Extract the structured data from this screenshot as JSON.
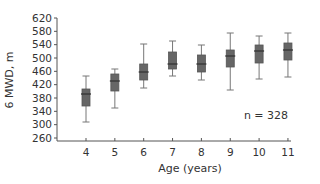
{
  "chart_data": {
    "type": "box",
    "title": "",
    "xlabel": "Age (years)",
    "ylabel": "6 MWD, m",
    "ylim": [
      260,
      620
    ],
    "yticks": [
      260,
      300,
      340,
      380,
      420,
      460,
      500,
      540,
      580,
      620
    ],
    "categories": [
      "4",
      "5",
      "6",
      "7",
      "8",
      "9",
      "10",
      "11"
    ],
    "grid": false,
    "legend": null,
    "annotations": [
      "n = 328"
    ],
    "boxes": [
      {
        "category": "4",
        "whisker_low": 308,
        "q1": 356,
        "median": 392,
        "q3": 407,
        "whisker_high": 446
      },
      {
        "category": "5",
        "whisker_low": 350,
        "q1": 401,
        "median": 431,
        "q3": 452,
        "whisker_high": 467
      },
      {
        "category": "6",
        "whisker_low": 410,
        "q1": 434,
        "median": 458,
        "q3": 482,
        "whisker_high": 542
      },
      {
        "category": "7",
        "whisker_low": 446,
        "q1": 467,
        "median": 482,
        "q3": 518,
        "whisker_high": 551
      },
      {
        "category": "8",
        "whisker_low": 434,
        "q1": 458,
        "median": 482,
        "q3": 509,
        "whisker_high": 539
      },
      {
        "category": "9",
        "whisker_low": 404,
        "q1": 473,
        "median": 506,
        "q3": 524,
        "whisker_high": 575
      },
      {
        "category": "10",
        "whisker_low": 437,
        "q1": 485,
        "median": 521,
        "q3": 539,
        "whisker_high": 566
      },
      {
        "category": "11",
        "whisker_low": 443,
        "q1": 494,
        "median": 524,
        "q3": 545,
        "whisker_high": 575
      }
    ],
    "colors": {
      "box_fill": "#666666",
      "box_stroke": "#555555",
      "whisker": "#777777",
      "median": "#333333",
      "axis": "#555555"
    }
  },
  "labels": {
    "xlabel": "Age (years)",
    "ylabel": "6 MWD, m",
    "annotation": "n = 328"
  }
}
